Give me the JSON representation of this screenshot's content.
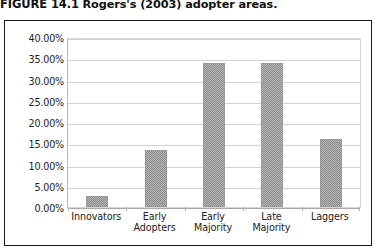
{
  "figure": {
    "caption_label": "FIGURE 14.1",
    "caption_text": "Rogers's (2003) adopter areas."
  },
  "chart_data": {
    "type": "bar",
    "title": "Rogers's (2003) adopter areas.",
    "categories": [
      "Innovators",
      "Early Adopters",
      "Early Majority",
      "Late Majority",
      "Laggers"
    ],
    "values": [
      2.5,
      13.5,
      34.0,
      34.0,
      16.0
    ],
    "value_labels": [
      "2.50%",
      "13.50%",
      "34.00%",
      "34.00%",
      "16.00%"
    ],
    "xlabel": "",
    "ylabel": "",
    "ylim": [
      0,
      40
    ],
    "ytick_step": 5,
    "ytick_labels": [
      "40.00%",
      "35.00%",
      "30.00%",
      "25.00%",
      "20.00%",
      "15.00%",
      "10.00%",
      "5.00%",
      "0.00%"
    ],
    "ytick_values": [
      40,
      35,
      30,
      25,
      20,
      15,
      10,
      5,
      0
    ],
    "grid": true,
    "legend": false,
    "legend_position": "none",
    "bar_color": "#9a9a9a",
    "gridline_color": "#d2d2d2",
    "plot_background": "#ffffff",
    "frame_color": "#1a1a1a"
  }
}
